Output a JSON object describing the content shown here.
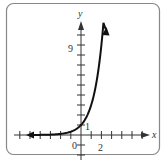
{
  "chart_data": {
    "type": "line",
    "title": "",
    "function": "y = 3^x",
    "xlabel": "x",
    "ylabel": "y",
    "x_tick_labels": [
      {
        "value": 0,
        "label": "0"
      },
      {
        "value": 2,
        "label": "2"
      }
    ],
    "y_tick_labels": [
      {
        "value": 1,
        "label": "1"
      },
      {
        "value": 9,
        "label": "9"
      }
    ],
    "xlim": [
      -6.5,
      6.5
    ],
    "ylim": [
      -2.5,
      11.5
    ],
    "x_ticks": [
      -6,
      -5,
      -4,
      -3,
      -2,
      -1,
      1,
      2,
      3,
      4,
      5,
      6
    ],
    "y_ticks": [
      -2,
      -1,
      1,
      2,
      3,
      4,
      5,
      6,
      7,
      8,
      9,
      10
    ],
    "grid": false,
    "legend": null,
    "series": [
      {
        "name": "y = 3^x",
        "x": [
          -5.2,
          -4,
          -3,
          -2,
          -1,
          0,
          0.5,
          1,
          1.5,
          2,
          2.2,
          2.45
        ],
        "y": [
          0.003,
          0.012,
          0.037,
          0.111,
          0.333,
          1,
          1.73,
          3,
          5.2,
          9,
          11.2,
          14.8
        ],
        "arrows": [
          "left",
          "up"
        ]
      }
    ]
  },
  "labels": {
    "x_axis": "x",
    "y_axis": "y",
    "origin": "0",
    "x_two": "2",
    "y_one": "1",
    "y_nine": "9"
  }
}
